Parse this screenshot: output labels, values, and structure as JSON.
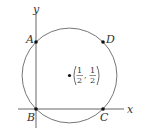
{
  "diagram": {
    "axes": {
      "x_label": "x",
      "y_label": "y"
    },
    "circle": {
      "center_label": {
        "x_num": "1",
        "x_den": "2",
        "y_num": "1",
        "y_den": "2"
      }
    },
    "points": [
      {
        "id": "A",
        "label": "A"
      },
      {
        "id": "B",
        "label": "B"
      },
      {
        "id": "C",
        "label": "C"
      },
      {
        "id": "D",
        "label": "D"
      }
    ],
    "colors": {
      "stroke": "#555555",
      "text": "#333333"
    }
  }
}
